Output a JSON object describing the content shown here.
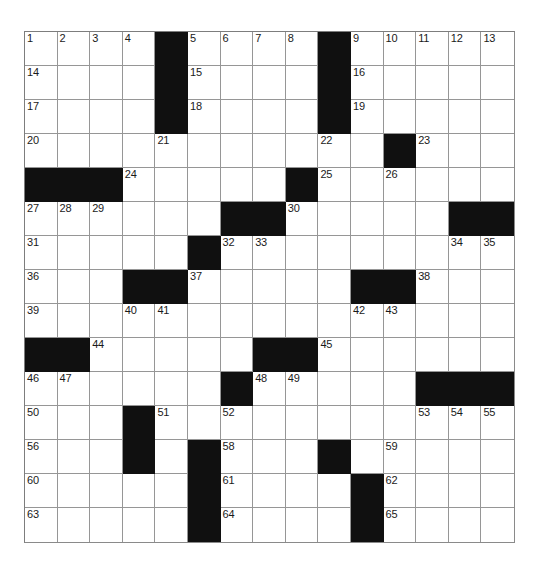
{
  "puzzle": {
    "type": "crossword-grid",
    "title": "Crossword Puzzle Grid",
    "columns": 15,
    "rows": 15,
    "cell_size_px": 32.7,
    "colors": {
      "block": "#101010",
      "cell": "#ffffff",
      "grid_line": "#969696",
      "number_text": "#1a1a1a",
      "page_background": "#ffffff"
    },
    "highest_clue_number": 65,
    "legend": {
      "block_symbol": "#",
      "open_symbol": "."
    },
    "layout_rows": [
      "....#....#.....",
      "....#....#.....",
      "....#....#.....",
      "...........#...",
      "###.....#......",
      "......##.....##",
      ".....#.........",
      "...##.....##...",
      "...............",
      "##.....##......",
      "......#.....###",
      "...#...........",
      "...#.#...#.....",
      ".....#....#....",
      ".....#....#...."
    ],
    "numbers": [
      {
        "n": 1,
        "row": 0,
        "col": 0
      },
      {
        "n": 2,
        "row": 0,
        "col": 1
      },
      {
        "n": 3,
        "row": 0,
        "col": 2
      },
      {
        "n": 4,
        "row": 0,
        "col": 3
      },
      {
        "n": 5,
        "row": 0,
        "col": 5
      },
      {
        "n": 6,
        "row": 0,
        "col": 6
      },
      {
        "n": 7,
        "row": 0,
        "col": 7
      },
      {
        "n": 8,
        "row": 0,
        "col": 8
      },
      {
        "n": 9,
        "row": 0,
        "col": 10
      },
      {
        "n": 10,
        "row": 0,
        "col": 11
      },
      {
        "n": 11,
        "row": 0,
        "col": 12
      },
      {
        "n": 12,
        "row": 0,
        "col": 13
      },
      {
        "n": 13,
        "row": 0,
        "col": 14
      },
      {
        "n": 14,
        "row": 1,
        "col": 0
      },
      {
        "n": 15,
        "row": 1,
        "col": 5
      },
      {
        "n": 16,
        "row": 1,
        "col": 10
      },
      {
        "n": 17,
        "row": 2,
        "col": 0
      },
      {
        "n": 18,
        "row": 2,
        "col": 5
      },
      {
        "n": 19,
        "row": 2,
        "col": 10
      },
      {
        "n": 20,
        "row": 3,
        "col": 0
      },
      {
        "n": 21,
        "row": 3,
        "col": 4
      },
      {
        "n": 22,
        "row": 3,
        "col": 9
      },
      {
        "n": 23,
        "row": 3,
        "col": 12
      },
      {
        "n": 24,
        "row": 4,
        "col": 3
      },
      {
        "n": 25,
        "row": 4,
        "col": 9
      },
      {
        "n": 26,
        "row": 4,
        "col": 11
      },
      {
        "n": 27,
        "row": 5,
        "col": 0
      },
      {
        "n": 28,
        "row": 5,
        "col": 1
      },
      {
        "n": 29,
        "row": 5,
        "col": 2
      },
      {
        "n": 30,
        "row": 5,
        "col": 8
      },
      {
        "n": 31,
        "row": 6,
        "col": 0
      },
      {
        "n": 32,
        "row": 6,
        "col": 6
      },
      {
        "n": 33,
        "row": 6,
        "col": 7
      },
      {
        "n": 34,
        "row": 6,
        "col": 13
      },
      {
        "n": 35,
        "row": 6,
        "col": 14
      },
      {
        "n": 36,
        "row": 7,
        "col": 0
      },
      {
        "n": 37,
        "row": 7,
        "col": 5
      },
      {
        "n": 38,
        "row": 7,
        "col": 12
      },
      {
        "n": 39,
        "row": 8,
        "col": 0
      },
      {
        "n": 40,
        "row": 8,
        "col": 3
      },
      {
        "n": 41,
        "row": 8,
        "col": 4
      },
      {
        "n": 42,
        "row": 8,
        "col": 10
      },
      {
        "n": 43,
        "row": 8,
        "col": 11
      },
      {
        "n": 44,
        "row": 9,
        "col": 2
      },
      {
        "n": 45,
        "row": 9,
        "col": 9
      },
      {
        "n": 46,
        "row": 10,
        "col": 0
      },
      {
        "n": 47,
        "row": 10,
        "col": 1
      },
      {
        "n": 48,
        "row": 10,
        "col": 7
      },
      {
        "n": 49,
        "row": 10,
        "col": 8
      },
      {
        "n": 50,
        "row": 11,
        "col": 0
      },
      {
        "n": 51,
        "row": 11,
        "col": 4
      },
      {
        "n": 52,
        "row": 11,
        "col": 6
      },
      {
        "n": 53,
        "row": 11,
        "col": 12
      },
      {
        "n": 54,
        "row": 11,
        "col": 13
      },
      {
        "n": 55,
        "row": 11,
        "col": 14
      },
      {
        "n": 56,
        "row": 12,
        "col": 0
      },
      {
        "n": 57,
        "row": 12,
        "col": 3
      },
      {
        "n": 58,
        "row": 12,
        "col": 6
      },
      {
        "n": 59,
        "row": 12,
        "col": 11
      },
      {
        "n": 60,
        "row": 13,
        "col": 0
      },
      {
        "n": 61,
        "row": 13,
        "col": 6
      },
      {
        "n": 62,
        "row": 13,
        "col": 11
      },
      {
        "n": 63,
        "row": 14,
        "col": 0
      },
      {
        "n": 64,
        "row": 14,
        "col": 6
      },
      {
        "n": 65,
        "row": 14,
        "col": 11
      }
    ]
  }
}
